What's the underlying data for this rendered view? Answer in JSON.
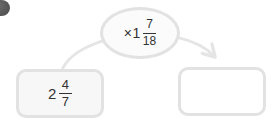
{
  "palette": {
    "border": "#e2e2e2",
    "boxFill": "#f7f7f7",
    "ovalFill": "#fbfbfb",
    "arrow": "#e5e5e5",
    "text": "#333333",
    "bullet": "#545454",
    "background": "#ffffff"
  },
  "multiplier": {
    "sign": "×",
    "whole": "1",
    "numerator": "7",
    "denominator": "18"
  },
  "start_value": {
    "whole": "2",
    "numerator": "4",
    "denominator": "7"
  },
  "answer": {
    "value": ""
  }
}
